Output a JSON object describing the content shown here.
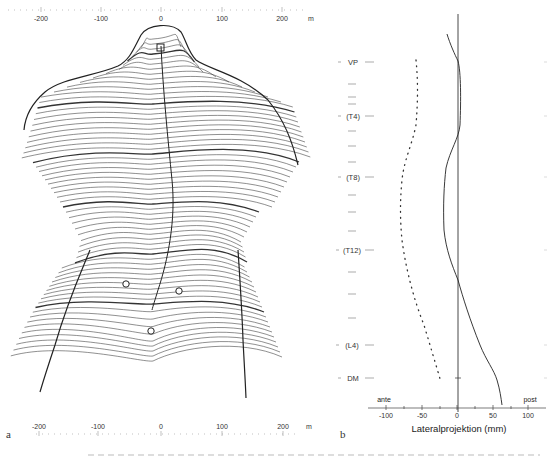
{
  "panel_a": {
    "letter": "a",
    "top_axis": {
      "ticks": [
        "-200",
        "-100",
        "0",
        "100",
        "200"
      ],
      "unit": "m"
    },
    "bottom_axis": {
      "ticks": [
        "-200",
        "-100",
        "0",
        "100",
        "200"
      ],
      "unit": "m"
    }
  },
  "panel_b": {
    "letter": "b",
    "xlabel": "Lateralprojektion (mm)",
    "side_left": "ante",
    "side_right": "post",
    "xticks": [
      "-100",
      "-50",
      "0",
      "50",
      "100"
    ],
    "levels": [
      "VP",
      "(T4)",
      "(T8)",
      "(T12)",
      "(L4)",
      "DM"
    ]
  },
  "chart_data": [
    {
      "type": "contour",
      "title": "Back surface topography (rasterstereography)",
      "xlabel": "",
      "ylabel": "",
      "x_ticks": [
        -200,
        -100,
        0,
        100,
        200
      ],
      "x_unit": "m",
      "xlim": [
        -220,
        230
      ],
      "landmarks": [
        {
          "name": "VP",
          "x": 0,
          "note": "top marker"
        },
        {
          "name": "dimple-left",
          "x": -55
        },
        {
          "name": "dimple-right",
          "x": 25
        },
        {
          "name": "DM",
          "x": -15,
          "note": "lower marker"
        }
      ],
      "contour_lines": "approx. 60 horizontal profile lines with a central spine midline"
    },
    {
      "type": "line",
      "title": "Lateral projection",
      "xlabel": "Lateralprojektion (mm)",
      "ylabel": "",
      "xlim": [
        -120,
        120
      ],
      "x_ticks": [
        -100,
        -50,
        0,
        50,
        100
      ],
      "y_categories": [
        "VP",
        "(T4)",
        "(T8)",
        "(T12)",
        "(L4)",
        "DM"
      ],
      "annotations": [
        "ante",
        "post"
      ],
      "series": [
        {
          "name": "surface profile (solid)",
          "style": "solid",
          "points": [
            {
              "level": "top",
              "x": -5
            },
            {
              "level": "VP",
              "x": 0
            },
            {
              "level": "(T4)",
              "x": 1
            },
            {
              "level": "(T8)",
              "x": -18
            },
            {
              "level": "(T12)",
              "x": -10
            },
            {
              "level": "(L4)",
              "x": 30
            },
            {
              "level": "DM",
              "x": 50
            },
            {
              "level": "bottom",
              "x": 58
            }
          ]
        },
        {
          "name": "spine midline (dotted)",
          "style": "dotted",
          "points": [
            {
              "level": "VP",
              "x": -58
            },
            {
              "level": "(T4)",
              "x": -62
            },
            {
              "level": "(T8)",
              "x": -78
            },
            {
              "level": "(T12)",
              "x": -78
            },
            {
              "level": "(L4)",
              "x": -55
            },
            {
              "level": "DM",
              "x": -35
            },
            {
              "level": "bottom",
              "x": -25
            }
          ]
        }
      ]
    }
  ]
}
